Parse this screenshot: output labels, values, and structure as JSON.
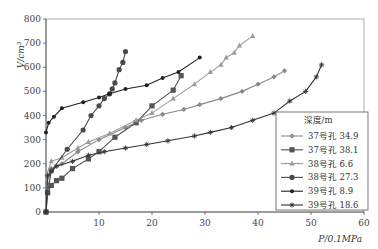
{
  "chart_data": {
    "type": "line",
    "title": "",
    "xlabel": "P/0.1MPa",
    "ylabel": "V/cm³",
    "xlim": [
      0,
      60
    ],
    "ylim": [
      0,
      800
    ],
    "xticks": [
      10,
      20,
      30,
      40,
      50,
      60
    ],
    "yticks": [
      0,
      100,
      200,
      300,
      400,
      500,
      600,
      700,
      800
    ],
    "grid": false,
    "legend": {
      "title": "深度/m",
      "placement": "bottom-right"
    },
    "series": [
      {
        "name": "37号孔  34.9",
        "marker": "diamond",
        "color": "#8a8a8a",
        "x": [
          0,
          0.2,
          1,
          3,
          6,
          10,
          15,
          18,
          22,
          26,
          29,
          33,
          37,
          40,
          43,
          45
        ],
        "y": [
          0,
          120,
          180,
          200,
          250,
          300,
          350,
          380,
          405,
          425,
          445,
          470,
          500,
          530,
          560,
          585
        ]
      },
      {
        "name": "37号孔  38.1",
        "marker": "square",
        "color": "#555555",
        "x": [
          0,
          0.3,
          1,
          2,
          3,
          5,
          8,
          10,
          13,
          17,
          20,
          24,
          25.5
        ],
        "y": [
          0,
          80,
          110,
          130,
          140,
          180,
          220,
          250,
          310,
          370,
          440,
          505,
          565
        ]
      },
      {
        "name": "38号孔  6.6",
        "marker": "triangle",
        "color": "#9a9a9a",
        "x": [
          0,
          0.2,
          1,
          3,
          6,
          8,
          12,
          17,
          20,
          24,
          28,
          31,
          33,
          34,
          35.5,
          36.5,
          39
        ],
        "y": [
          0,
          160,
          210,
          225,
          265,
          290,
          325,
          380,
          410,
          470,
          530,
          580,
          610,
          640,
          660,
          690,
          730
        ]
      },
      {
        "name": "38号孔  27.3",
        "marker": "circle",
        "color": "#4a4a4a",
        "x": [
          0,
          0.3,
          1,
          4,
          7,
          8.5,
          10,
          11,
          12,
          12.5,
          13,
          13.8,
          14.5,
          15
        ],
        "y": [
          0,
          80,
          170,
          260,
          340,
          400,
          440,
          470,
          490,
          510,
          535,
          590,
          620,
          665
        ]
      },
      {
        "name": "39号孔  8.9",
        "marker": "dot",
        "color": "#222222",
        "x": [
          0,
          0.5,
          1.5,
          3,
          7,
          10,
          12,
          15,
          19,
          22,
          25,
          29
        ],
        "y": [
          330,
          370,
          395,
          430,
          455,
          475,
          490,
          510,
          525,
          555,
          580,
          640
        ]
      },
      {
        "name": "39号孔  18.6",
        "marker": "asterisk",
        "color": "#333333",
        "x": [
          0,
          0.3,
          2,
          5,
          8,
          11,
          15,
          19,
          23,
          28,
          31,
          35,
          39,
          43,
          46,
          49,
          51,
          52
        ],
        "y": [
          0,
          150,
          190,
          210,
          235,
          250,
          265,
          280,
          295,
          315,
          330,
          350,
          380,
          410,
          460,
          500,
          560,
          610
        ]
      }
    ]
  }
}
